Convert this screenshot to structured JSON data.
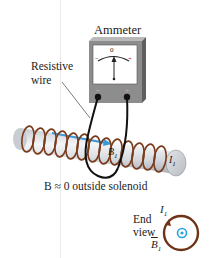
{
  "diagram": {
    "type": "physics-illustration",
    "labels": {
      "ammeter": "Ammeter",
      "resistive_wire_line1": "Resistive",
      "resistive_wire_line2": "wire",
      "meter_zero": "0",
      "meter_minus": "−",
      "meter_plus": "+",
      "terminal_minus": "−",
      "terminal_plus": "+",
      "field_inside": "B",
      "field_inside_sub": "1",
      "current": "I",
      "current_sub": "1",
      "outside_note": "B ≈ 0 outside solenoid",
      "end_view_line1": "End",
      "end_view_line2": "view",
      "end_current": "I",
      "end_current_sub": "1",
      "end_field": "B",
      "end_field_sub": "1"
    },
    "colors": {
      "coil": "#7a3b1c",
      "field_arrow": "#3a9ad9",
      "meter_body": "#8a8a8a",
      "wire": "#111111",
      "cylinder": "#d9dde2",
      "end_dot": "#29a3dc"
    }
  }
}
